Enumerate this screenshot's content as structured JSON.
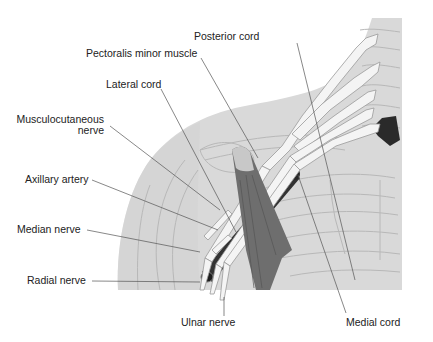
{
  "figure": {
    "type": "anatomical-illustration",
    "colors": {
      "background": "#ffffff",
      "body_silhouette": "#d9d9d9",
      "bone_outline": "#b8b8b8",
      "nerves": "#f4f4f4",
      "nerve_outline": "#9a9a9a",
      "artery": "#3a3a3a",
      "muscle": "#6e6e6e",
      "leader_lines": "#555555",
      "label_text": "#222222"
    }
  },
  "labels": [
    {
      "id": "posterior-cord",
      "text": "Posterior cord"
    },
    {
      "id": "pectoralis-minor-muscle",
      "text": "Pectoralis minor muscle"
    },
    {
      "id": "lateral-cord",
      "text": "Lateral cord"
    },
    {
      "id": "musculocutaneous-nerve",
      "text": "Musculocutaneous",
      "text2": "nerve"
    },
    {
      "id": "axillary-artery",
      "text": "Axillary artery"
    },
    {
      "id": "median-nerve",
      "text": "Median nerve"
    },
    {
      "id": "radial-nerve",
      "text": "Radial nerve"
    },
    {
      "id": "ulnar-nerve",
      "text": "Ulnar nerve"
    },
    {
      "id": "medial-cord",
      "text": "Medial cord"
    }
  ]
}
